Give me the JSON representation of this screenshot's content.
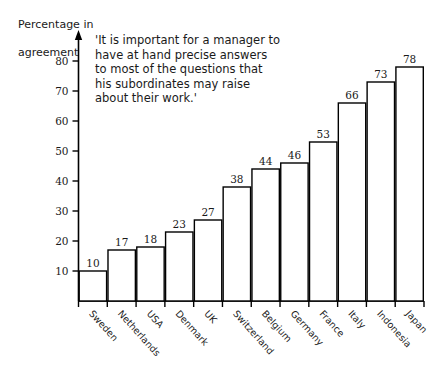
{
  "chart_data": {
    "type": "bar",
    "title": "",
    "subtitle": "",
    "ylabel_line1": "Percentage in",
    "ylabel_line2": "agreement",
    "xlabel": "",
    "ylim": [
      0,
      80
    ],
    "ytick_step": 10,
    "yticks": [
      10,
      20,
      30,
      40,
      50,
      60,
      70,
      80
    ],
    "ytick_labels": [
      "10",
      "20",
      "30",
      "40",
      "50",
      "60",
      "70",
      "80"
    ],
    "grid": false,
    "legend": "none",
    "categories": [
      "Sweden",
      "Netherlands",
      "USA",
      "Denmark",
      "UK",
      "Switzerland",
      "Belgium",
      "Germany",
      "France",
      "Italy",
      "Indonesia",
      "Japan"
    ],
    "values": [
      10,
      17,
      18,
      23,
      27,
      38,
      44,
      46,
      53,
      66,
      73,
      78
    ],
    "bars": [
      {
        "category": "Sweden",
        "value": 10,
        "label": "10"
      },
      {
        "category": "Netherlands",
        "value": 17,
        "label": "17"
      },
      {
        "category": "USA",
        "value": 18,
        "label": "18"
      },
      {
        "category": "Denmark",
        "value": 23,
        "label": "23"
      },
      {
        "category": "UK",
        "value": 27,
        "label": "27"
      },
      {
        "category": "Switzerland",
        "value": 38,
        "label": "38"
      },
      {
        "category": "Belgium",
        "value": 44,
        "label": "44"
      },
      {
        "category": "Germany",
        "value": 46,
        "label": "46"
      },
      {
        "category": "France",
        "value": 53,
        "label": "53"
      },
      {
        "category": "Italy",
        "value": 66,
        "label": "66"
      },
      {
        "category": "Indonesia",
        "value": 73,
        "label": "73"
      },
      {
        "category": "Japan",
        "value": 78,
        "label": "78"
      }
    ],
    "annotation": {
      "lines": [
        "'It is important for a manager to",
        "have at hand precise answers",
        "to most of the questions that",
        "his subordinates may raise",
        "about their work.'"
      ]
    },
    "colors": {
      "bar_fill": "#ffffff",
      "bar_stroke": "#000000",
      "axis": "#000000",
      "text": "#1a1a1a",
      "background": "#ffffff"
    }
  }
}
